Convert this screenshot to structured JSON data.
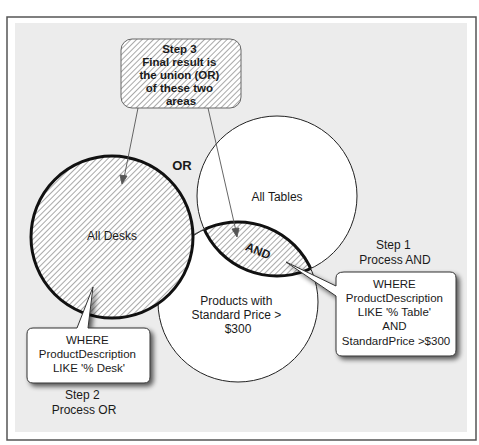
{
  "diagram": {
    "title": "",
    "colors": {
      "panel_bg": "#ececec",
      "frame": "#555555",
      "circle_fill": "#ffffff",
      "hatch": "#7a7a7a",
      "stroke": "#111111"
    },
    "step3_box": {
      "lines": [
        "Step 3",
        "Final result is",
        "the union (OR)",
        "of these two",
        "areas"
      ]
    },
    "or_label": "OR",
    "circles": {
      "desks": {
        "label": "All Desks"
      },
      "tables": {
        "label": "All Tables"
      },
      "products": {
        "lines": [
          "Products with",
          "Standard Price >",
          "$300"
        ]
      }
    },
    "and_label": "AND",
    "step1": {
      "lines": [
        "Step 1",
        "Process AND"
      ]
    },
    "step1_callout": {
      "lines": [
        "WHERE",
        "ProductDescription",
        "LIKE '% Table'",
        "AND",
        "StandardPrice >$300"
      ]
    },
    "step2": {
      "lines": [
        "Step 2",
        "Process OR"
      ]
    },
    "step2_callout": {
      "lines": [
        "WHERE",
        "ProductDescription",
        "LIKE '% Desk'"
      ]
    }
  }
}
